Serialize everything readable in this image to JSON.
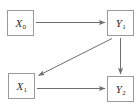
{
  "diagram": {
    "type": "directed-graph",
    "background_color": "#ffffff",
    "node_border_color": "#9a9a9a",
    "edge_color": "#6e6e6e",
    "label_color": "#2b2b2b",
    "nodes": [
      {
        "id": "x0",
        "base": "X",
        "subscript": "0",
        "label": "X0"
      },
      {
        "id": "y1",
        "base": "Y",
        "subscript": "1",
        "label": "Y1"
      },
      {
        "id": "x1",
        "base": "X",
        "subscript": "1",
        "label": "X1"
      },
      {
        "id": "y2",
        "base": "Y",
        "subscript": "2",
        "label": "Y2"
      }
    ],
    "edges": [
      {
        "id": "x0-to-y1",
        "from": "x0",
        "to": "y1",
        "orientation": "horizontal"
      },
      {
        "id": "y1-to-x1",
        "from": "y1",
        "to": "x1",
        "orientation": "diagonal"
      },
      {
        "id": "y1-to-y2",
        "from": "y1",
        "to": "y2",
        "orientation": "vertical"
      },
      {
        "id": "x1-to-y2",
        "from": "x1",
        "to": "y2",
        "orientation": "horizontal"
      }
    ]
  }
}
